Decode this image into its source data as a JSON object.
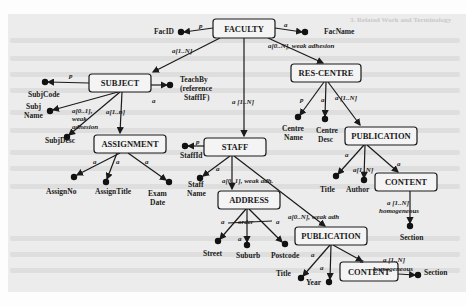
{
  "figure": {
    "type": "ORA-SS schema diagram",
    "background_heading": "3. Related Work and Terminology",
    "nodes": [
      {
        "id": "faculty",
        "label": "FACULTY",
        "x": 213,
        "y": 19,
        "w": 62,
        "h": 19
      },
      {
        "id": "subject",
        "label": "SUBJECT",
        "x": 89,
        "y": 74,
        "w": 62,
        "h": 18
      },
      {
        "id": "res_centre",
        "label": "RES-CENTRE",
        "x": 291,
        "y": 64,
        "w": 70,
        "h": 18
      },
      {
        "id": "assignment",
        "label": "ASSIGNMENT",
        "x": 94,
        "y": 135,
        "w": 72,
        "h": 18
      },
      {
        "id": "staff",
        "label": "STAFF",
        "x": 204,
        "y": 138,
        "w": 62,
        "h": 18
      },
      {
        "id": "publication_rc",
        "label": "PUBLICATION",
        "x": 345,
        "y": 127,
        "w": 72,
        "h": 18
      },
      {
        "id": "content_rc",
        "label": "CONTENT",
        "x": 375,
        "y": 173,
        "w": 62,
        "h": 18
      },
      {
        "id": "address",
        "label": "ADDRESS",
        "x": 218,
        "y": 191,
        "w": 62,
        "h": 18
      },
      {
        "id": "publication_st",
        "label": "PUBLICATION",
        "x": 295,
        "y": 227,
        "w": 72,
        "h": 18
      },
      {
        "id": "content_st",
        "label": "CONTENT",
        "x": 340,
        "y": 262,
        "w": 58,
        "h": 19
      }
    ],
    "attributes": [
      {
        "label": "FacID",
        "dot": [
          181,
          32
        ],
        "text": [
          154,
          34
        ]
      },
      {
        "label": "FacName",
        "dot": [
          305,
          32
        ],
        "text": [
          324,
          34
        ]
      },
      {
        "label": "SubjCode",
        "dot": [
          45,
          82
        ],
        "text": [
          28,
          97
        ]
      },
      {
        "label": "TeachBy",
        "dot": [
          170,
          85
        ],
        "text": [
          180,
          82
        ]
      },
      {
        "label": "(reference",
        "dot": null,
        "text": [
          180,
          91
        ]
      },
      {
        "label": "StaffIF)",
        "dot": null,
        "text": [
          184,
          100
        ]
      },
      {
        "label": "Subj",
        "dot": [
          50,
          111
        ],
        "text": [
          26,
          109
        ]
      },
      {
        "label": "Name",
        "dot": null,
        "text": [
          24,
          118
        ]
      },
      {
        "label": "SubjDesc",
        "dot": [
          67,
          137
        ],
        "text": [
          45,
          143
        ]
      },
      {
        "label": "AssignNo",
        "dot": [
          74,
          177
        ],
        "text": [
          46,
          194
        ]
      },
      {
        "label": "AssignTitle",
        "dot": [
          106,
          182
        ],
        "text": [
          95,
          194
        ]
      },
      {
        "label": "Exam",
        "dot": [
          169,
          182
        ],
        "text": [
          148,
          196
        ]
      },
      {
        "label": "Date",
        "dot": null,
        "text": [
          150,
          205
        ]
      },
      {
        "label": "StaffId",
        "dot": [
          185,
          146
        ],
        "text": [
          180,
          158
        ]
      },
      {
        "label": "Staff",
        "dot": [
          200,
          178
        ],
        "text": [
          188,
          187
        ]
      },
      {
        "label": "Name",
        "dot": null,
        "text": [
          187,
          196
        ]
      },
      {
        "label": "Centre",
        "dot": [
          298,
          117
        ],
        "text": [
          282,
          131
        ]
      },
      {
        "label": "Name",
        "dot": null,
        "text": [
          284,
          140
        ]
      },
      {
        "label": "Centre",
        "dot": [
          325,
          119
        ],
        "text": [
          316,
          133
        ]
      },
      {
        "label": "Desc",
        "dot": null,
        "text": [
          318,
          142
        ]
      },
      {
        "label": "Title",
        "dot": [
          336,
          176
        ],
        "text": [
          320,
          192
        ]
      },
      {
        "label": "Author",
        "dot": [
          364,
          180
        ],
        "text": [
          346,
          192
        ]
      },
      {
        "label": "Section",
        "dot": [
          410,
          226
        ],
        "text": [
          400,
          240
        ]
      },
      {
        "label": "Street",
        "dot": [
          218,
          241
        ],
        "text": [
          203,
          256
        ]
      },
      {
        "label": "Suburb",
        "dot": [
          247,
          245
        ],
        "text": [
          236,
          258
        ]
      },
      {
        "label": "Postcode",
        "dot": [
          285,
          244
        ],
        "text": [
          271,
          258
        ]
      },
      {
        "label": "Title",
        "dot": [
          301,
          278
        ],
        "text": [
          276,
          276
        ]
      },
      {
        "label": "Year",
        "dot": [
          329,
          282
        ],
        "text": [
          306,
          285
        ]
      },
      {
        "label": "Section",
        "dot": [
          418,
          275
        ],
        "text": [
          424,
          275
        ]
      }
    ],
    "edge_labels": [
      {
        "text": "p",
        "x": 199,
        "y": 28
      },
      {
        "text": "a",
        "x": 284,
        "y": 27
      },
      {
        "text": "a[1..N]",
        "x": 172,
        "y": 53
      },
      {
        "text": "a[0..N], weak adhesion",
        "x": 268,
        "y": 48
      },
      {
        "text": "p",
        "x": 69,
        "y": 78
      },
      {
        "text": "a",
        "x": 152,
        "y": 103
      },
      {
        "text": "a[0..1],",
        "x": 72,
        "y": 113
      },
      {
        "text": "weak",
        "x": 72,
        "y": 121
      },
      {
        "text": "adhesion",
        "x": 72,
        "y": 129
      },
      {
        "text": "a[1..n]",
        "x": 106,
        "y": 114
      },
      {
        "text": "a [1..N]",
        "x": 232,
        "y": 104
      },
      {
        "text": "p",
        "x": 300,
        "y": 102
      },
      {
        "text": "a",
        "x": 321,
        "y": 102
      },
      {
        "text": "a [1..N]",
        "x": 335,
        "y": 100
      },
      {
        "text": "p",
        "x": 196,
        "y": 144
      },
      {
        "text": "a",
        "x": 216,
        "y": 171
      },
      {
        "text": "a[0..1], weak adh.",
        "x": 222,
        "y": 183
      },
      {
        "text": "a",
        "x": 93,
        "y": 164
      },
      {
        "text": "a",
        "x": 116,
        "y": 164
      },
      {
        "text": "a",
        "x": 145,
        "y": 164
      },
      {
        "text": "a",
        "x": 345,
        "y": 157
      },
      {
        "text": "a[1..N]",
        "x": 353,
        "y": 172
      },
      {
        "text": "a",
        "x": 397,
        "y": 166
      },
      {
        "text": "a [1..N]",
        "x": 387,
        "y": 205
      },
      {
        "text": "homogeneous",
        "x": 379,
        "y": 213
      },
      {
        "text": "order",
        "x": 238,
        "y": 224
      },
      {
        "text": "a",
        "x": 221,
        "y": 224
      },
      {
        "text": "a",
        "x": 276,
        "y": 224
      },
      {
        "text": "a",
        "x": 238,
        "y": 241
      },
      {
        "text": "a[0..N], weak adh",
        "x": 288,
        "y": 219
      },
      {
        "text": "a",
        "x": 311,
        "y": 257
      },
      {
        "text": "a",
        "x": 320,
        "y": 270
      },
      {
        "text": "a",
        "x": 360,
        "y": 263
      },
      {
        "text": "a [1..N]",
        "x": 383,
        "y": 262
      },
      {
        "text": "homogeneous",
        "x": 373,
        "y": 271
      }
    ]
  }
}
